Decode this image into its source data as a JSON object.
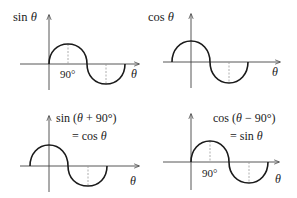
{
  "figure": {
    "panels": [
      {
        "id": "sin",
        "y_label": "sin θ",
        "y_label_func": "sin",
        "x_label": "θ",
        "tick_label": "90°",
        "equation_line1": "",
        "equation_line2": ""
      },
      {
        "id": "cos",
        "y_label": "cos θ",
        "y_label_func": "cos",
        "x_label": "θ",
        "tick_label": "",
        "equation_line1": "",
        "equation_line2": ""
      },
      {
        "id": "sin-shift",
        "y_label": "",
        "x_label": "θ",
        "tick_label": "",
        "equation_line1": "sin (θ + 90°)",
        "equation_line2": "= cos θ"
      },
      {
        "id": "cos-shift",
        "y_label": "",
        "x_label": "θ",
        "tick_label": "90°",
        "equation_line1": "cos (θ − 90°)",
        "equation_line2": "= sin θ"
      }
    ],
    "colors": {
      "curve": "#1a1a1a",
      "axis": "#444444",
      "dashed": "#9a9a9a",
      "background": "#ffffff"
    }
  },
  "labels": {
    "p1_func": "sin",
    "p1_var": "θ",
    "p1_tick": "90°",
    "p1_x": "θ",
    "p2_func": "cos",
    "p2_var": "θ",
    "p2_x": "θ",
    "p3_eq1_a": "sin (",
    "p3_eq1_var": "θ",
    "p3_eq1_b": " + 90°)",
    "p3_eq2_a": "= cos ",
    "p3_eq2_var": "θ",
    "p3_x": "θ",
    "p4_eq1_a": "cos (",
    "p4_eq1_var": "θ",
    "p4_eq1_b": " − 90°)",
    "p4_eq2_a": "= sin ",
    "p4_eq2_var": "θ",
    "p4_tick": "90°",
    "p4_x": "θ"
  }
}
